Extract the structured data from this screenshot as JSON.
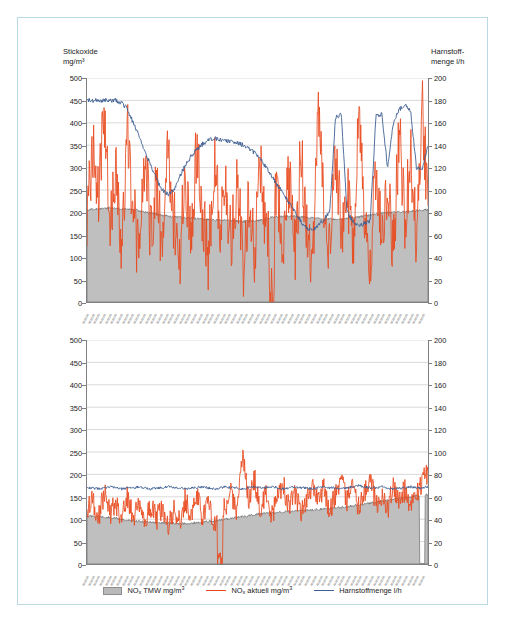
{
  "axes": {
    "left_title": "Stickoxide\nmg/m³",
    "right_title": "Harnstoff-\nmenge l/h",
    "left_ticks": [
      "500",
      "450",
      "400",
      "350",
      "300",
      "250",
      "200",
      "150",
      "100",
      "50",
      "0"
    ],
    "right_ticks": [
      "200",
      "180",
      "160",
      "140",
      "120",
      "100",
      "80",
      "60",
      "40",
      "20",
      "0"
    ]
  },
  "legend": {
    "items": [
      {
        "label": "NOx TMW mg/m³",
        "marker": "area-swatch",
        "color": "#b9b9b9"
      },
      {
        "label": "NOx aktuell mg/m³",
        "marker": "line-swatch",
        "color": "#e8491e"
      },
      {
        "label": "Harnstoffmenge l/h",
        "marker": "line-swatch",
        "color": "#3f5f93"
      }
    ]
  },
  "chart_data": [
    {
      "id": "chart-top",
      "type": "line",
      "title": "",
      "xlabel": "",
      "ylabel": "Stickoxide mg/m³",
      "y2label": "Harnstoffmenge l/h",
      "ylim": [
        0,
        500
      ],
      "y2lim": [
        0,
        200
      ],
      "grid": true,
      "legend_position": "bottom",
      "xticks_rotated": true,
      "xtick_count": 60,
      "xtick_labels_illegible": true,
      "series": [
        {
          "name": "NOx TMW mg/m³",
          "type": "area",
          "color": "#b9b9b9",
          "axis": "left",
          "values": [
            205,
            207,
            208,
            209,
            210,
            209,
            208,
            207,
            206,
            204,
            200,
            198,
            196,
            194,
            192,
            190,
            189,
            188,
            187,
            186,
            185,
            184,
            183,
            182,
            182,
            181,
            181,
            180,
            180,
            180,
            183,
            186,
            189,
            191,
            192,
            192,
            191,
            190,
            189,
            188,
            187,
            186,
            186,
            185,
            185,
            186,
            188,
            190,
            192,
            194,
            196,
            198,
            199,
            200,
            201,
            202,
            203,
            204,
            205,
            206
          ]
        },
        {
          "name": "NOx aktuell mg/m³",
          "type": "line",
          "color": "#e8491e",
          "axis": "left",
          "values": [
            180,
            340,
            250,
            410,
            160,
            300,
            120,
            380,
            210,
            95,
            330,
            150,
            270,
            110,
            350,
            190,
            80,
            300,
            140,
            360,
            200,
            100,
            320,
            170,
            260,
            130,
            290,
            60,
            240,
            110,
            300,
            160,
            0,
            220,
            140,
            280,
            100,
            340,
            180,
            90,
            420,
            210,
            130,
            350,
            170,
            250,
            120,
            430,
            200,
            100,
            300,
            150,
            260,
            110,
            380,
            190,
            320,
            140,
            430,
            220
          ]
        },
        {
          "name": "Harnstoffmenge l/h",
          "type": "line",
          "color": "#3f5f93",
          "axis": "right",
          "values": [
            180,
            180,
            180,
            180,
            180,
            180,
            178,
            172,
            160,
            148,
            135,
            122,
            110,
            100,
            96,
            100,
            112,
            122,
            130,
            136,
            141,
            144,
            146,
            145,
            144,
            143,
            142,
            140,
            137,
            133,
            128,
            120,
            112,
            104,
            96,
            88,
            80,
            72,
            66,
            64,
            68,
            74,
            80,
            165,
            168,
            80,
            72,
            68,
            70,
            72,
            166,
            168,
            120,
            160,
            172,
            176,
            170,
            120,
            118,
            140
          ]
        }
      ]
    },
    {
      "id": "chart-bottom",
      "type": "line",
      "title": "",
      "xlabel": "",
      "ylabel": "Stickoxide mg/m³",
      "y2label": "Harnstoffmenge l/h",
      "ylim": [
        0,
        500
      ],
      "y2lim": [
        0,
        200
      ],
      "grid": true,
      "legend_position": "bottom",
      "xticks_rotated": true,
      "xtick_count": 60,
      "xtick_labels_illegible": true,
      "series": [
        {
          "name": "NOx TMW mg/m³",
          "type": "area",
          "color": "#b9b9b9",
          "axis": "left",
          "values": [
            108,
            107,
            106,
            105,
            104,
            102,
            100,
            98,
            96,
            95,
            94,
            93,
            92,
            92,
            91,
            91,
            90,
            90,
            91,
            92,
            93,
            95,
            96,
            98,
            100,
            102,
            104,
            106,
            108,
            110,
            112,
            113,
            114,
            115,
            116,
            117,
            118,
            119,
            120,
            121,
            122,
            123,
            124,
            125,
            126,
            128,
            130,
            132,
            134,
            136,
            138,
            140,
            142,
            144,
            146,
            148,
            150,
            152,
            0,
            155
          ]
        },
        {
          "name": "NOx aktuell mg/m³",
          "type": "line",
          "color": "#e8491e",
          "axis": "left",
          "values": [
            120,
            145,
            100,
            160,
            110,
            135,
            95,
            150,
            105,
            140,
            90,
            130,
            100,
            125,
            85,
            120,
            95,
            145,
            110,
            155,
            100,
            135,
            90,
            0,
            130,
            160,
            115,
            245,
            140,
            190,
            120,
            165,
            105,
            150,
            175,
            125,
            160,
            110,
            145,
            180,
            130,
            170,
            120,
            155,
            185,
            140,
            175,
            125,
            160,
            190,
            135,
            150,
            120,
            175,
            145,
            165,
            130,
            155,
            185,
            200
          ]
        },
        {
          "name": "Harnstoffmenge l/h",
          "type": "line",
          "color": "#3f5f93",
          "axis": "right",
          "values": [
            68,
            68,
            67,
            68,
            69,
            68,
            67,
            68,
            68,
            69,
            68,
            67,
            68,
            68,
            69,
            68,
            68,
            67,
            68,
            68,
            69,
            68,
            67,
            68,
            69,
            68,
            68,
            67,
            68,
            69,
            68,
            68,
            69,
            68,
            67,
            68,
            69,
            68,
            68,
            67,
            68,
            69,
            68,
            68,
            67,
            68,
            69,
            70,
            69,
            68,
            68,
            69,
            68,
            67,
            68,
            68,
            69,
            68,
            68,
            69
          ]
        }
      ]
    }
  ]
}
